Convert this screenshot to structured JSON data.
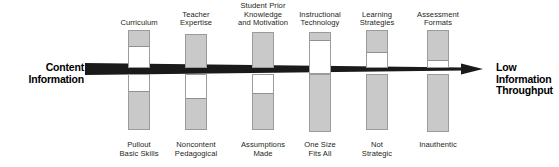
{
  "diagram": {
    "left_label": {
      "lines": [
        "Content",
        "Information"
      ]
    },
    "right_label": {
      "lines": [
        "Low",
        "Information",
        "Throughput"
      ]
    },
    "arrow": {
      "color": "#1a1a1a",
      "start_thickness_px": 12,
      "end_thickness_px": 3,
      "direction": "left-to-right",
      "arrowhead": "right"
    },
    "colors": {
      "bar_fill": "#c9c9c9",
      "bar_outline": "#9b9b9b",
      "bar_empty": "#ffffff",
      "text": "#231f20",
      "arrow": "#1a1a1a"
    },
    "columns": [
      {
        "x": 128,
        "top_label": [
          "Curriculum"
        ],
        "bottom_label": [
          "Pullout",
          "Basic Skills"
        ],
        "upper_bar": {
          "top": 30,
          "height": 38,
          "fill_from_top_pct": 45
        },
        "lower_bar": {
          "top": 74,
          "height": 56,
          "fill_from_bottom_pct": 70
        }
      },
      {
        "x": 185,
        "top_label": [
          "Teacher",
          "Expertise"
        ],
        "bottom_label": [
          "Noncontent",
          "Pedagogical"
        ],
        "upper_bar": {
          "top": 34,
          "height": 34,
          "fill_from_top_pct": 100
        },
        "lower_bar": {
          "top": 74,
          "height": 56,
          "fill_from_bottom_pct": 58
        }
      },
      {
        "x": 252,
        "top_label": [
          "Student Prior",
          "Knowledge",
          "and Motivation"
        ],
        "bottom_label": [
          "Assumptions",
          "Made"
        ],
        "upper_bar": {
          "top": 32,
          "height": 36,
          "fill_from_top_pct": 100
        },
        "lower_bar": {
          "top": 74,
          "height": 56,
          "fill_from_bottom_pct": 66
        }
      },
      {
        "x": 309,
        "top_label": [
          "Instructional",
          "Technology"
        ],
        "bottom_label": [
          "One Size",
          "Fits All"
        ],
        "upper_bar": {
          "top": 32,
          "height": 42,
          "fill_from_top_pct": 20
        },
        "lower_bar": {
          "top": 74,
          "height": 58,
          "fill_from_bottom_pct": 100
        }
      },
      {
        "x": 366,
        "top_label": [
          "Learning",
          "Strategies"
        ],
        "bottom_label": [
          "Not",
          "Strategic"
        ],
        "upper_bar": {
          "top": 30,
          "height": 38,
          "fill_from_top_pct": 62
        },
        "lower_bar": {
          "top": 74,
          "height": 56,
          "fill_from_bottom_pct": 100
        }
      },
      {
        "x": 427,
        "top_label": [
          "Assessment",
          "Formats"
        ],
        "bottom_label": [
          "Inauthentic"
        ],
        "upper_bar": {
          "top": 30,
          "height": 38,
          "fill_from_top_pct": 82
        },
        "lower_bar": {
          "top": 74,
          "height": 58,
          "fill_from_bottom_pct": 100
        }
      }
    ]
  }
}
